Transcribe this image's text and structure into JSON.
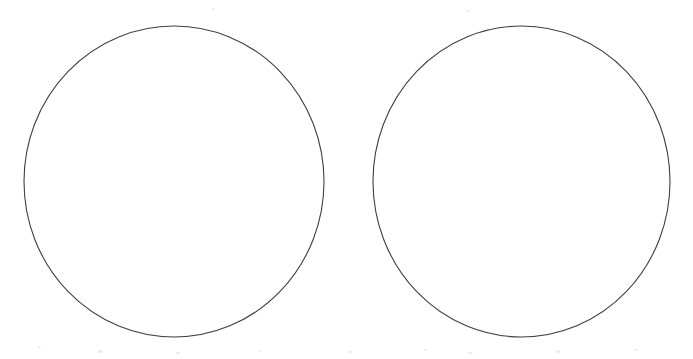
{
  "canvas": {
    "width": 693,
    "height": 359,
    "background_color": "#ffffff",
    "title": "Two Circles"
  },
  "style": {
    "stroke_color": "#3f3f42",
    "stroke_width": 1.1,
    "fill": "none",
    "speck_color": "#d9d9dd"
  },
  "shapes": [
    {
      "name": "left-circle",
      "type": "circle",
      "cx": 174,
      "cy": 181.5,
      "r": 155,
      "rx": 150,
      "ry": 155.5,
      "bbox": {
        "left": 24,
        "top": 26,
        "right": 324,
        "bottom": 337
      },
      "stroke": "#3f3f42",
      "stroke_width": 1.1,
      "fill": "none"
    },
    {
      "name": "right-circle",
      "type": "circle",
      "cx": 521.5,
      "cy": 181.5,
      "r": 155,
      "rx": 148.5,
      "ry": 155.5,
      "bbox": {
        "left": 373,
        "top": 26,
        "right": 670,
        "bottom": 337
      },
      "stroke": "#3f3f42",
      "stroke_width": 1.1,
      "fill": "none"
    }
  ],
  "chart_data": {
    "type": "scatter",
    "title": "",
    "subtitle": "",
    "xlabel": "",
    "ylabel": "",
    "grid": false,
    "legend": "none",
    "xlim": [
      0,
      693
    ],
    "ylim": [
      0,
      359
    ],
    "annotations": [],
    "series": [
      {
        "name": "left-circle",
        "shape": "circle",
        "center": [
          174,
          181.5
        ],
        "radius": 155,
        "values": []
      },
      {
        "name": "right-circle",
        "shape": "circle",
        "center": [
          521.5,
          181.5
        ],
        "radius": 155,
        "values": []
      }
    ]
  },
  "specks": [
    {
      "x": 38,
      "y": 346,
      "w": 3,
      "h": 2
    },
    {
      "x": 98,
      "y": 350,
      "w": 5,
      "h": 3
    },
    {
      "x": 176,
      "y": 352,
      "w": 4,
      "h": 2
    },
    {
      "x": 258,
      "y": 350,
      "w": 3,
      "h": 2
    },
    {
      "x": 348,
      "y": 351,
      "w": 4,
      "h": 2
    },
    {
      "x": 424,
      "y": 349,
      "w": 3,
      "h": 2
    },
    {
      "x": 468,
      "y": 352,
      "w": 5,
      "h": 2
    },
    {
      "x": 556,
      "y": 350,
      "w": 4,
      "h": 3
    },
    {
      "x": 634,
      "y": 349,
      "w": 3,
      "h": 2
    },
    {
      "x": 212,
      "y": 8,
      "w": 3,
      "h": 2
    },
    {
      "x": 466,
      "y": 10,
      "w": 3,
      "h": 2
    }
  ]
}
